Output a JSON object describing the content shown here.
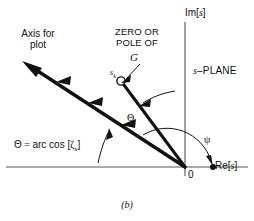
{
  "figure": {
    "caption": "(b)",
    "labels": {
      "axis_for_plot": "Axis for\nplot",
      "zero_or_pole_of": "ZERO OR\nPOLE OF",
      "g": "G",
      "sk": "s",
      "sk_sub": "k",
      "im_axis": "Im[s]",
      "im_axis_prefix": "Im[",
      "im_axis_var": "s",
      "im_axis_suffix": "]",
      "s_plane_var": "s",
      "s_plane_text": "–PLANE",
      "re_axis_prefix": "Re[",
      "re_axis_var": "s",
      "re_axis_suffix": "]",
      "origin": "0",
      "theta_equation_theta": "Θ",
      "theta_equation_eq": " = ",
      "theta_equation_fn": "arc cos [",
      "theta_equation_zeta": "ζ",
      "theta_equation_sub": "x",
      "theta_equation_close": "]",
      "theta_angle": "Θ",
      "psi": "ψ"
    },
    "colors": {
      "ink": "#111111",
      "axis": "#555555",
      "background": "#ffffff"
    },
    "geometry": {
      "origin_x": 185,
      "origin_y": 167,
      "im_axis_top_y": 22,
      "re_axis_left_x": 6,
      "re_axis_right_x": 248,
      "plot_axis_end_x": 24,
      "plot_axis_end_y": 62,
      "sk_point_x": 123,
      "sk_point_y": 82,
      "re_dot_x": 213,
      "re_dot_y": 167,
      "theta_degrees": 148,
      "psi_degrees": 118
    }
  }
}
